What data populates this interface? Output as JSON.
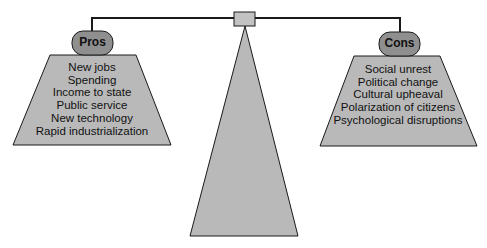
{
  "diagram": {
    "type": "balance-scale",
    "colors": {
      "fill": "#b9b9b9",
      "pill_fill": "#8f8f8f",
      "stroke": "#1a1a1a",
      "background": "#ffffff"
    },
    "pros": {
      "label": "Pros",
      "items": [
        "New jobs",
        "Spending",
        "Income to state",
        "Public service",
        "New technology",
        "Rapid industrialization"
      ]
    },
    "cons": {
      "label": "Cons",
      "items": [
        "Social unrest",
        "Political change",
        "Cultural upheaval",
        "Polarization of citizens",
        "Psychological disruptions"
      ]
    }
  }
}
